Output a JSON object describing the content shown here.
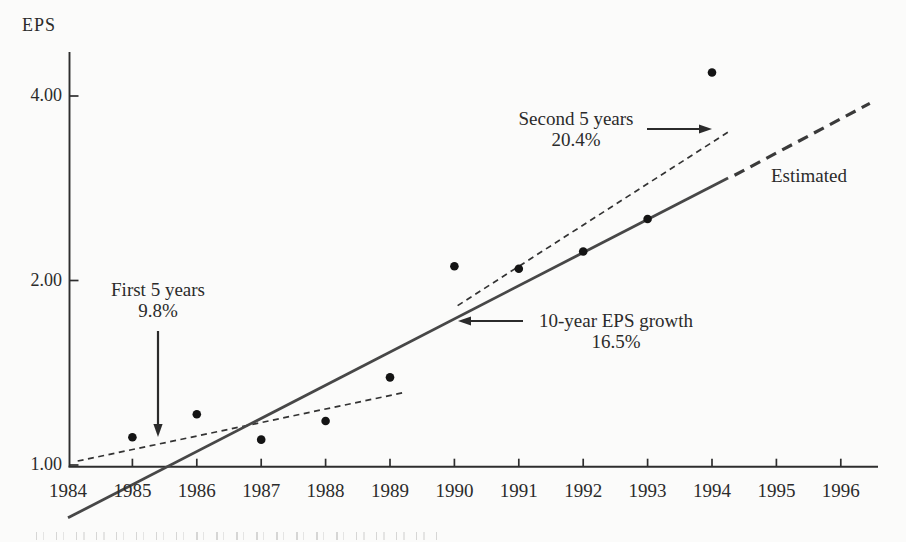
{
  "chart": {
    "ylabel": "EPS"
  },
  "annotations": {
    "first5": {
      "line1": "First 5 years",
      "line2": "9.8%"
    },
    "second5": {
      "line1": "Second 5 years",
      "line2": "20.4%"
    },
    "tenyear": {
      "line1": "10-year EPS growth",
      "line2": "16.5%"
    },
    "estimated": "Estimated"
  },
  "chart_data": {
    "type": "scatter",
    "ylabel": "EPS",
    "x": [
      1985,
      1986,
      1987,
      1988,
      1989,
      1990,
      1991,
      1992,
      1993,
      1994
    ],
    "values": [
      1.11,
      1.21,
      1.1,
      1.18,
      1.39,
      2.11,
      2.09,
      2.23,
      2.52,
      4.37
    ],
    "x_axis": {
      "range": [
        1984,
        1996.6
      ],
      "tick_years": [
        1985,
        1986,
        1987,
        1988,
        1989,
        1990,
        1991,
        1992,
        1993,
        1994,
        1995,
        1996
      ],
      "labels": [
        "1984",
        "1985",
        "1986",
        "1987",
        "1988",
        "1989",
        "1990",
        "1991",
        "1992",
        "1993",
        "1994",
        "1995",
        "1996"
      ],
      "label_years": [
        1984,
        1985,
        1986,
        1987,
        1988,
        1989,
        1990,
        1991,
        1992,
        1993,
        1994,
        1995,
        1996
      ]
    },
    "y_axis": {
      "scale": "log2",
      "range": [
        0.78,
        4.75
      ],
      "ticks": [
        {
          "value": 1,
          "label": "1.00"
        },
        {
          "value": 2,
          "label": "2.00"
        },
        {
          "value": 4,
          "label": "4.00"
        }
      ]
    },
    "grid": false,
    "legend": "none",
    "trend_lines": [
      {
        "name": "first-5-years",
        "label": "First 5 years",
        "rate": "9.8%",
        "style": "dashed-thin",
        "from": {
          "year": 1984.15,
          "eps": 1.015
        },
        "to": {
          "year": 1989.25,
          "eps": 1.315
        }
      },
      {
        "name": "second-5-years",
        "label": "Second 5 years",
        "rate": "20.4%",
        "style": "dashed-thin",
        "from": {
          "year": 1990.05,
          "eps": 1.82
        },
        "to": {
          "year": 1994.3,
          "eps": 3.52
        }
      },
      {
        "name": "ten-year-growth",
        "label": "10-year EPS growth",
        "rate": "16.5%",
        "style": "solid",
        "from": {
          "year": 1984.0,
          "eps": 0.82
        },
        "to": {
          "year": 1994.25,
          "eps": 2.94
        }
      },
      {
        "name": "estimated",
        "label": "Estimated",
        "style": "dashed-thick",
        "from": {
          "year": 1994.35,
          "eps": 2.97
        },
        "to": {
          "year": 1996.45,
          "eps": 3.89
        }
      }
    ]
  },
  "layout": {
    "calibration": {
      "x_1984": 68,
      "px_per_year": 64.4,
      "y_eps1": 465,
      "px_per_doubling": 184.5
    },
    "axes": {
      "left": 69.5,
      "top": 52,
      "bottom": 466.7,
      "right": 878
    },
    "colors": {
      "ink": "#2b2b2b",
      "axis": "#2e2e2e",
      "dot": "#141414",
      "solid_line": "#474747",
      "dashed_thin": "#333333",
      "dashed_thick": "#3a3a3a"
    },
    "arrows": [
      {
        "name": "first-5-years-arrow",
        "x1": 158,
        "y1": 331,
        "x2": 158,
        "y2": 437
      },
      {
        "name": "second-5-years-arrow",
        "x1": 647,
        "y1": 129,
        "x2": 712,
        "y2": 129
      },
      {
        "name": "ten-year-growth-arrow",
        "x1": 523,
        "y1": 321,
        "x2": 458,
        "y2": 321
      }
    ]
  }
}
